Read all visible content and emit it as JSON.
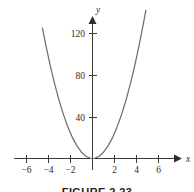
{
  "figure": {
    "caption": "FIGURE 2.23",
    "background_color": "#ffffff",
    "curve_color": "#6e6e72",
    "axis_color": "#3a3a3a",
    "text_color": "#2b2b2b"
  },
  "chart_data": {
    "type": "line",
    "title": "",
    "subtitle": "",
    "xlabel": "x",
    "ylabel": "y",
    "xlim": [
      -7.2,
      7.3
    ],
    "ylim": [
      -10,
      135
    ],
    "grid": false,
    "legend": null,
    "x_ticks": [
      -6,
      -4,
      -2,
      2,
      4,
      6
    ],
    "x_tick_labels": [
      "−6",
      "−4",
      "−2",
      "2",
      "4",
      "6"
    ],
    "y_ticks": [
      40,
      80,
      120
    ],
    "y_tick_labels": [
      "40",
      "80",
      "120"
    ],
    "annotations": [],
    "series": [
      {
        "name": "parabola",
        "equation": "y = 6x^2",
        "color": "#6e6e72",
        "x": [
          -4.55,
          -4.2,
          -3.8,
          -3.4,
          -3.0,
          -2.6,
          -2.2,
          -1.8,
          -1.4,
          -1.0,
          -0.6,
          -0.2,
          0,
          0.2,
          0.6,
          1.0,
          1.4,
          1.8,
          2.2,
          2.6,
          3.0,
          3.4,
          3.8,
          4.2,
          4.6,
          4.85
        ],
        "values": [
          124.2,
          105.8,
          86.6,
          69.4,
          54.0,
          40.6,
          29.0,
          19.4,
          11.8,
          6.0,
          2.2,
          0.2,
          0,
          0.2,
          2.2,
          6.0,
          11.8,
          19.4,
          29.0,
          40.6,
          54.0,
          69.4,
          86.6,
          105.8,
          127.0,
          141.1
        ]
      }
    ]
  }
}
